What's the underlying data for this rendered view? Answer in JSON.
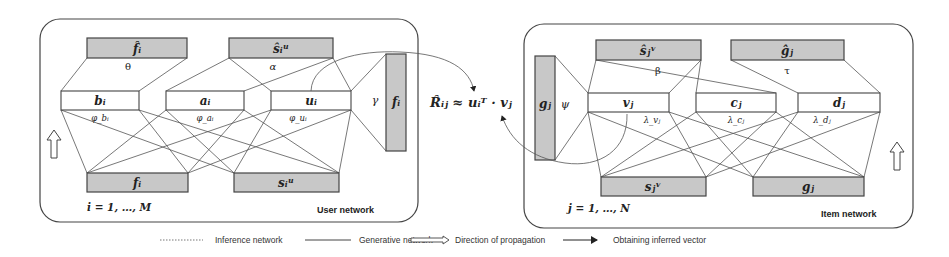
{
  "user_network": {
    "title": "User network",
    "index_label": "i = 1, …, M",
    "top_outputs": [
      {
        "label": "f̂ᵢ",
        "param": "θ"
      },
      {
        "label": "ŝᵢᵘ",
        "param": "α"
      }
    ],
    "latent": [
      {
        "label": "bᵢ",
        "param": "φ_bᵢ"
      },
      {
        "label": "aᵢ",
        "param": "φ_aᵢ"
      },
      {
        "label": "uᵢ",
        "param": "φ_uᵢ"
      }
    ],
    "inputs": [
      {
        "label": "fᵢ"
      },
      {
        "label": "sᵢᵘ"
      }
    ],
    "side_output": {
      "label": "fᵢ",
      "param": "γ"
    }
  },
  "item_network": {
    "title": "Item network",
    "index_label": "j = 1, …, N",
    "top_outputs": [
      {
        "label": "ŝⱼᵛ",
        "param": "β"
      },
      {
        "label": "ĝⱼ",
        "param": "τ"
      }
    ],
    "latent": [
      {
        "label": "vⱼ",
        "param": "λ_vⱼ"
      },
      {
        "label": "cⱼ",
        "param": "λ_cⱼ"
      },
      {
        "label": "dⱼ",
        "param": "λ_dⱼ"
      }
    ],
    "inputs": [
      {
        "label": "sⱼᵛ"
      },
      {
        "label": "gⱼ"
      }
    ],
    "side_output": {
      "label": "gⱼ",
      "param": "ψ"
    }
  },
  "equation": "R̂ᵢⱼ ≈ uᵢᵀ · vⱼ",
  "legend": [
    {
      "style": "dotted-line",
      "label": "Inference network"
    },
    {
      "style": "solid-line",
      "label": "Generative network"
    },
    {
      "style": "hollow-arrow",
      "label": "Direction of propagation"
    },
    {
      "style": "solid-arrow",
      "label": "Obtaining inferred vector"
    }
  ]
}
